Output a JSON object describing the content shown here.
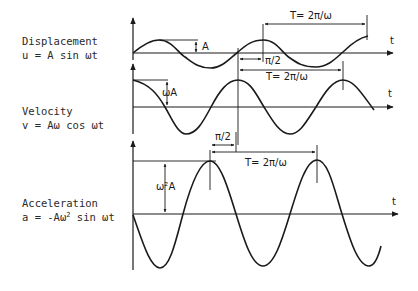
{
  "panels": [
    {
      "name": "displacement",
      "title": "Displacement",
      "equation": "u = A sin ωt",
      "amplitude_label": "A",
      "axis_label": "t",
      "period_label": "T= 2π/ω",
      "phase_label": "π/2"
    },
    {
      "name": "velocity",
      "title": "Velocity",
      "equation": "v = Aω  cos ωt",
      "amplitude_label": "ωA",
      "axis_label": "t",
      "period_label": "T= 2π/ω",
      "phase_label": "π/2"
    },
    {
      "name": "acceleration",
      "title": "Acceleration",
      "equation_prefix": "a = -Aω",
      "equation_sup": "2",
      "equation_suffix": " sin ωt",
      "amplitude_label": "ω²A",
      "axis_label": "t",
      "period_label": "T= 2π/ω"
    }
  ],
  "colors": {
    "ink": "#1a1a1a",
    "background": "#ffffff"
  }
}
